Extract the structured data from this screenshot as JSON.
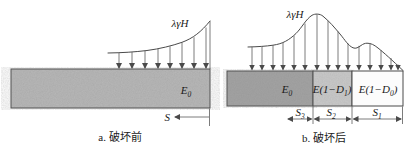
{
  "colors": {
    "line": "#4a4a4a",
    "beam_before_fill": "#b8b8b8",
    "beam_e0_fill": "#a3a3a3",
    "beam_d1_fill": "#c9c9c9",
    "beam_d0_fill": "#fcfcfc"
  },
  "panel_a": {
    "load_label": "λγH",
    "modulus_base": "E",
    "modulus_sub": "0",
    "span_label": "S",
    "caption": "a. 破坏前"
  },
  "panel_b": {
    "load_label": "λγH",
    "segments": [
      {
        "pre": "E",
        "sub": "0",
        "post": ""
      },
      {
        "pre": "E(1−D",
        "sub": "1",
        "post": ")"
      },
      {
        "pre": "E(1−D",
        "sub": "0",
        "post": ")"
      }
    ],
    "spans": [
      {
        "base": "S",
        "sub": "3"
      },
      {
        "base": "S",
        "sub": "2"
      },
      {
        "base": "S",
        "sub": "1"
      }
    ],
    "caption": "b. 破坏后"
  }
}
